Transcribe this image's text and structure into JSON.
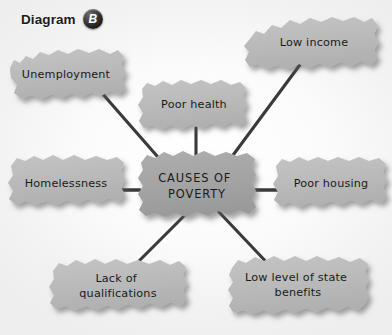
{
  "header": {
    "title": "Diagram",
    "badge_letter": "B",
    "badge_name": "diagram-label-badge"
  },
  "diagram": {
    "type": "spider-mind-map",
    "center": {
      "id": "causes-of-poverty",
      "lines": [
        "CAUSES OF",
        "POVERTY"
      ],
      "text": "CAUSES OF POVERTY"
    },
    "nodes": [
      {
        "id": "unemployment",
        "lines": [
          "Unemployment"
        ],
        "text": "Unemployment"
      },
      {
        "id": "poor-health",
        "lines": [
          "Poor health"
        ],
        "text": "Poor health"
      },
      {
        "id": "low-income",
        "lines": [
          "Low income"
        ],
        "text": "Low income"
      },
      {
        "id": "poor-housing",
        "lines": [
          "Poor housing"
        ],
        "text": "Poor housing"
      },
      {
        "id": "low-level-of-state-benefits",
        "lines": [
          "Low level of state",
          "benefits"
        ],
        "text": "Low level of state benefits"
      },
      {
        "id": "lack-of-qualifications",
        "lines": [
          "Lack of",
          "qualifications"
        ],
        "text": "Lack of qualifications"
      },
      {
        "id": "homelessness",
        "lines": [
          "Homelessness"
        ],
        "text": "Homelessness"
      }
    ],
    "connector_count": 6
  },
  "colors": {
    "background": "#f4f4f4",
    "center_node_fill": "#b0b0b0",
    "outer_node_fill": "#cdcdcd",
    "connector_line": "#3a3a3a",
    "text": "#1a1a1a",
    "badge_background": "#1c1c1c",
    "badge_text": "#ffffff"
  }
}
